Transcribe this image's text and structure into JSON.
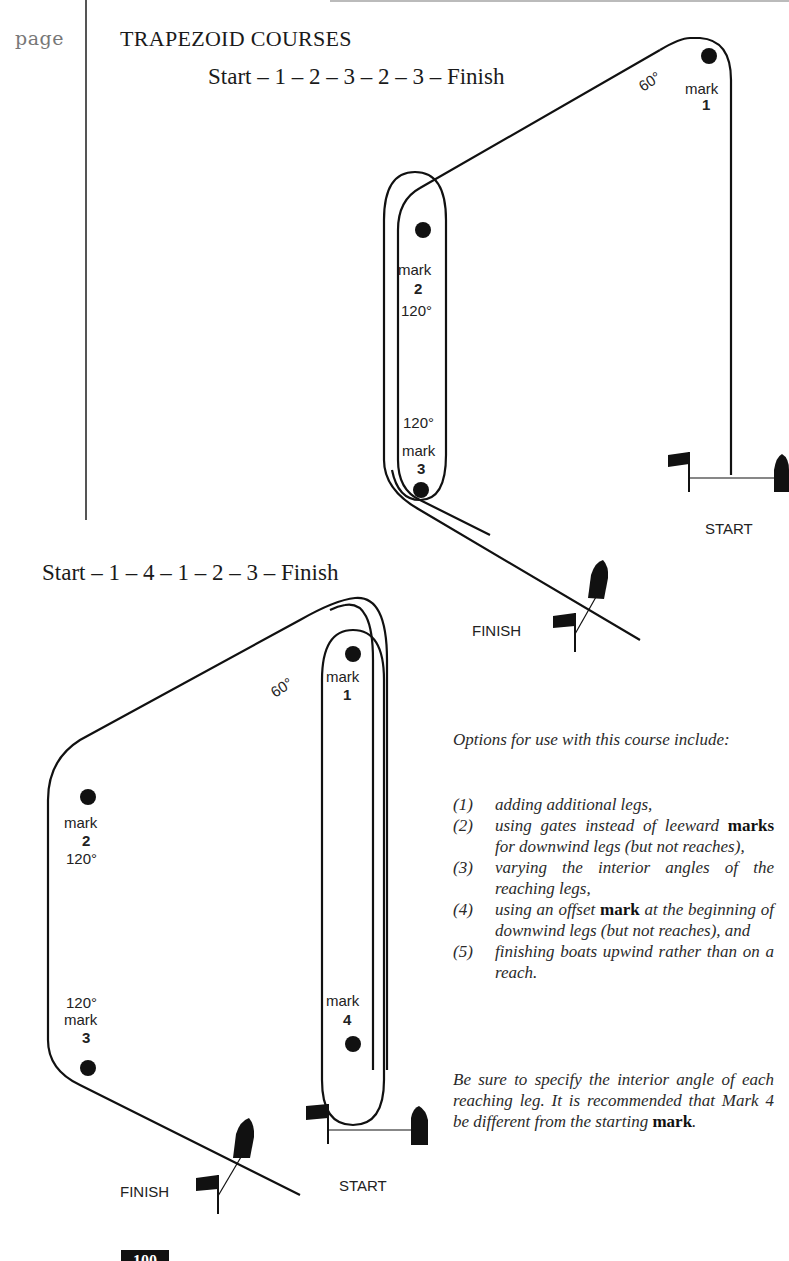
{
  "margin_label": "page",
  "section_title": "TRAPEZOID COURSES",
  "courses": [
    {
      "sequence": "Start – 1 – 2 – 3 – 2 – 3 – Finish",
      "marks": [
        {
          "word": "mark",
          "num": "1"
        },
        {
          "word": "mark",
          "num": "2"
        },
        {
          "word": "mark",
          "num": "3"
        }
      ],
      "angles": [
        "60°",
        "120°",
        "120°"
      ],
      "start_label": "START",
      "finish_label": "FINISH"
    },
    {
      "sequence": "Start – 1 – 4 – 1 – 2 – 3 – Finish",
      "marks": [
        {
          "word": "mark",
          "num": "1"
        },
        {
          "word": "mark",
          "num": "2"
        },
        {
          "word": "mark",
          "num": "3"
        },
        {
          "word": "mark",
          "num": "4"
        }
      ],
      "angles": [
        "60°",
        "120°",
        "120°"
      ],
      "start_label": "START",
      "finish_label": "FINISH"
    }
  ],
  "text": {
    "intro": "Options for use with this course include:",
    "options": [
      {
        "num": "(1)",
        "pre": "adding additional legs,",
        "bold": "",
        "post": ""
      },
      {
        "num": "(2)",
        "pre": "using gates instead of leeward ",
        "bold": "marks",
        "post": " for downwind legs (but not reaches),"
      },
      {
        "num": "(3)",
        "pre": "varying the interior angles of the reaching legs,",
        "bold": "",
        "post": ""
      },
      {
        "num": "(4)",
        "pre": "using an offset ",
        "bold": "mark",
        "post": " at the beginning of downwind legs (but not reaches), and"
      },
      {
        "num": "(5)",
        "pre": "finishing boats upwind rather than on a reach.",
        "bold": "",
        "post": ""
      }
    ],
    "note_pre": "Be sure to specify the interior angle of each reaching leg. It is recommended that Mark 4 be different from the starting ",
    "note_bold": "mark",
    "note_post": "."
  },
  "page_number": "100"
}
